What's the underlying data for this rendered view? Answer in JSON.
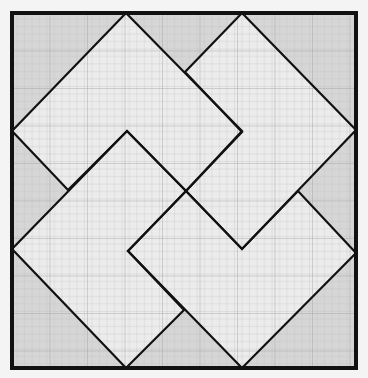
{
  "diagram": {
    "frame": {
      "x": 12,
      "y": 13,
      "width": 344,
      "height": 355
    },
    "grid": {
      "spacing": 7.5,
      "color": "#b4b4b4",
      "major_every": 5,
      "major_color": "#9a9a9a"
    },
    "colors": {
      "page": "#f4f4f4",
      "background_fill": "#d6d6d6",
      "shape_fill": "#ececec",
      "stroke": "#111111"
    },
    "shapes": [
      {
        "name": "top-left-l-shape",
        "points": "126,13 242,131 186,191 127,131 68,190 12,131"
      },
      {
        "name": "top-right-l-shape",
        "points": "242,13 356,130 242,249 186,191 242,132 185,72"
      },
      {
        "name": "bottom-left-l-shape",
        "points": "12,249 127,131 186,191 128,251 184,310 126,368"
      },
      {
        "name": "bottom-right-l-shape",
        "points": "356,253 242,368 128,251 186,191 242,249 298,191"
      }
    ]
  }
}
